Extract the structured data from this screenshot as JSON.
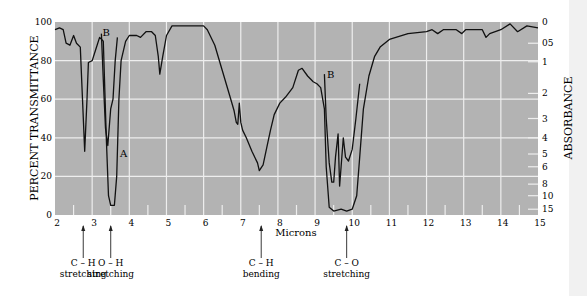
{
  "chart_data": {
    "type": "line",
    "title": "",
    "xlabel": "Microns",
    "ylabel": "PERCENT TRANSMITTANCE",
    "ylabel_right": "ABSORBANCE",
    "xlim": [
      2,
      15
    ],
    "ylim": [
      0,
      100
    ],
    "grid": true,
    "x_ticks": [
      2,
      3,
      4,
      5,
      6,
      7,
      8,
      9,
      10,
      11,
      12,
      13,
      14,
      15
    ],
    "y_ticks": [
      0,
      20,
      40,
      60,
      80,
      100
    ],
    "right_ticks": [
      {
        "label": "0",
        "pct": 100
      },
      {
        "label": "05",
        "pct": 89
      },
      {
        "label": "1",
        "pct": 79.4
      },
      {
        "label": "2",
        "pct": 63
      },
      {
        "label": "3",
        "pct": 50
      },
      {
        "label": "4",
        "pct": 40
      },
      {
        "label": "5",
        "pct": 31.6
      },
      {
        "label": "6",
        "pct": 25
      },
      {
        "label": "8",
        "pct": 16
      },
      {
        "label": "10",
        "pct": 10
      },
      {
        "label": "15",
        "pct": 3
      }
    ],
    "series": [
      {
        "name": "A",
        "label_pos": [
          3.75,
          30
        ],
        "points": [
          [
            2,
            96
          ],
          [
            2.12,
            97
          ],
          [
            2.22,
            96
          ],
          [
            2.3,
            89
          ],
          [
            2.4,
            88
          ],
          [
            2.5,
            93
          ],
          [
            2.58,
            89
          ],
          [
            2.68,
            87
          ],
          [
            2.74,
            60
          ],
          [
            2.8,
            33
          ],
          [
            2.86,
            60
          ],
          [
            2.9,
            79
          ],
          [
            3.0,
            80
          ],
          [
            3.1,
            86
          ],
          [
            3.2,
            92
          ],
          [
            3.3,
            90
          ],
          [
            3.38,
            40
          ],
          [
            3.44,
            10
          ],
          [
            3.5,
            5
          ],
          [
            3.6,
            5
          ],
          [
            3.66,
            20
          ],
          [
            3.72,
            60
          ],
          [
            3.78,
            80
          ],
          [
            3.9,
            90
          ],
          [
            4.0,
            93
          ],
          [
            4.2,
            93
          ],
          [
            4.3,
            92
          ],
          [
            4.45,
            95
          ],
          [
            4.6,
            95
          ],
          [
            4.7,
            93
          ],
          [
            4.78,
            82
          ],
          [
            4.82,
            73
          ],
          [
            4.9,
            82
          ],
          [
            5.0,
            93
          ],
          [
            5.15,
            98
          ],
          [
            5.5,
            98
          ],
          [
            6.0,
            98
          ],
          [
            6.1,
            96
          ],
          [
            6.3,
            88
          ],
          [
            6.5,
            75
          ],
          [
            6.7,
            62
          ],
          [
            6.82,
            54
          ],
          [
            6.88,
            48
          ],
          [
            6.92,
            47
          ],
          [
            6.96,
            58
          ],
          [
            7.0,
            48
          ],
          [
            7.05,
            44
          ],
          [
            7.15,
            40
          ],
          [
            7.3,
            33
          ],
          [
            7.45,
            27
          ],
          [
            7.5,
            23
          ],
          [
            7.6,
            26
          ],
          [
            7.7,
            35
          ],
          [
            7.8,
            44
          ],
          [
            7.9,
            52
          ],
          [
            8.05,
            58
          ],
          [
            8.2,
            61
          ],
          [
            8.4,
            66
          ],
          [
            8.55,
            75
          ],
          [
            8.65,
            76
          ],
          [
            8.8,
            72
          ],
          [
            8.95,
            69
          ],
          [
            9.05,
            68
          ],
          [
            9.15,
            66
          ],
          [
            9.25,
            55
          ],
          [
            9.3,
            25
          ],
          [
            9.38,
            4
          ],
          [
            9.5,
            2
          ],
          [
            9.7,
            3
          ],
          [
            9.85,
            2
          ],
          [
            10.0,
            3
          ],
          [
            10.12,
            10
          ],
          [
            10.2,
            30
          ],
          [
            10.3,
            55
          ],
          [
            10.45,
            72
          ],
          [
            10.6,
            82
          ],
          [
            10.75,
            87
          ],
          [
            11.0,
            91
          ],
          [
            11.5,
            94
          ],
          [
            12.0,
            95
          ],
          [
            12.15,
            96
          ],
          [
            12.3,
            94
          ],
          [
            12.45,
            96
          ],
          [
            12.8,
            96
          ],
          [
            12.95,
            94
          ],
          [
            13.05,
            96
          ],
          [
            13.5,
            96
          ],
          [
            13.6,
            92
          ],
          [
            13.7,
            94
          ],
          [
            14.0,
            96
          ],
          [
            14.25,
            99
          ],
          [
            14.45,
            95
          ],
          [
            14.7,
            98
          ],
          [
            15.0,
            97
          ]
        ]
      },
      {
        "name": "B",
        "label_pos": [
          3.28,
          93
        ],
        "points": [
          [
            3.25,
            94
          ],
          [
            3.3,
            70
          ],
          [
            3.36,
            45
          ],
          [
            3.42,
            36
          ],
          [
            3.5,
            55
          ],
          [
            3.56,
            60
          ],
          [
            3.62,
            80
          ],
          [
            3.68,
            92
          ]
        ]
      },
      {
        "name": "B",
        "label_pos": [
          9.32,
          71
        ],
        "points": [
          [
            9.25,
            73
          ],
          [
            9.3,
            50
          ],
          [
            9.38,
            27
          ],
          [
            9.45,
            17
          ],
          [
            9.5,
            17
          ],
          [
            9.55,
            30
          ],
          [
            9.62,
            42
          ],
          [
            9.66,
            15
          ],
          [
            9.7,
            25
          ],
          [
            9.76,
            40
          ],
          [
            9.82,
            30
          ],
          [
            9.9,
            28
          ],
          [
            10.0,
            34
          ],
          [
            10.1,
            50
          ],
          [
            10.2,
            68
          ]
        ]
      }
    ],
    "annotations": [
      {
        "x": 2.76,
        "text_lines": [
          "C – H",
          "stretching"
        ]
      },
      {
        "x": 3.5,
        "text_lines": [
          "O – H",
          "stretching"
        ]
      },
      {
        "x": 7.55,
        "text_lines": [
          "C – H",
          "bending"
        ]
      },
      {
        "x": 9.85,
        "text_lines": [
          "C – O",
          "stretching"
        ]
      }
    ],
    "colors": {
      "plot_bg": "#b3b3b3",
      "grid": "#eeeeee",
      "line": "#111111"
    }
  },
  "labels": {
    "ylabel": "PERCENT TRANSMITTANCE",
    "ylabel_right": "ABSORBANCE",
    "xlabel": "Microns"
  }
}
